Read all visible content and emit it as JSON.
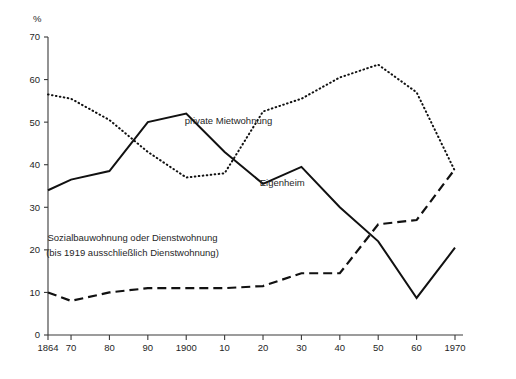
{
  "chart_data": {
    "type": "line",
    "title": "",
    "subtitle": "",
    "xlabel": "",
    "ylabel": "",
    "y_unit": "%",
    "xlim": [
      1864,
      1970
    ],
    "ylim": [
      0,
      70
    ],
    "grid": false,
    "legend_position": "inline-annotations",
    "x_tick_labels": [
      "1864",
      "70",
      "80",
      "90",
      "1900",
      "10",
      "20",
      "30",
      "40",
      "50",
      "60",
      "1970"
    ],
    "x_tick_values": [
      1864,
      1870,
      1880,
      1890,
      1900,
      1910,
      1920,
      1930,
      1940,
      1950,
      1960,
      1970
    ],
    "y_tick_labels": [
      "0",
      "10",
      "20",
      "30",
      "40",
      "50",
      "60",
      "70"
    ],
    "y_tick_values": [
      0,
      10,
      20,
      30,
      40,
      50,
      60,
      70
    ],
    "x": [
      1864,
      1870,
      1880,
      1890,
      1900,
      1910,
      1920,
      1930,
      1940,
      1950,
      1960,
      1970
    ],
    "series": [
      {
        "name": "private Mietwohnung",
        "style": "dotted",
        "label": "private Mietwohnung",
        "label_x": 1911,
        "label_y": 49.5,
        "values": [
          56.5,
          55.5,
          50.5,
          43.0,
          37.0,
          38.0,
          52.5,
          55.5,
          60.5,
          63.5,
          57.0,
          38.5
        ]
      },
      {
        "name": "Eigenheim",
        "style": "solid",
        "label": "Eigenheim",
        "label_x": 1925,
        "label_y": 35.0,
        "values": [
          34.0,
          36.5,
          38.5,
          50.0,
          52.0,
          43.0,
          35.5,
          39.5,
          30.0,
          22.0,
          8.7,
          20.5
        ]
      },
      {
        "name": "Sozialbauwohnung oder Dienstwohnung",
        "style": "dashed",
        "label": "Sozialbauwohnung oder Dienstwohnung",
        "label_note": "(bis 1919 ausschließlich Dienstwohnung)",
        "label_x": 1886,
        "label_y": 21.0,
        "values": [
          10.0,
          8.0,
          10.0,
          11.0,
          11.0,
          11.0,
          11.5,
          14.5,
          14.5,
          26.0,
          27.0,
          39.0
        ]
      }
    ],
    "annotations": [
      {
        "text": "private Mietwohnung",
        "x": 1911,
        "y": 49.5
      },
      {
        "text": "Eigenheim",
        "x": 1925,
        "y": 35.0
      },
      {
        "text": "Sozialbauwohnung oder Dienstwohnung",
        "x": 1886,
        "y": 22.0
      },
      {
        "text": "(bis 1919 ausschließlich Dienstwohnung)",
        "x": 1886,
        "y": 18.5
      }
    ],
    "colors": {
      "line": "#111111",
      "axis": "#3a3a3a",
      "background": "#ffffff",
      "text": "#1f1f1f"
    }
  }
}
